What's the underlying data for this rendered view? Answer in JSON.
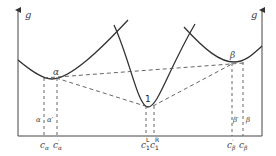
{
  "diagram": {
    "type": "free-energy composition diagram",
    "axes": {
      "left_axis_label": "g",
      "right_axis_label": "g"
    },
    "phases": [
      {
        "id": "alpha",
        "label": "α"
      },
      {
        "id": "one",
        "label": "1"
      },
      {
        "id": "beta",
        "label": "β"
      }
    ],
    "region_labels": {
      "alpha": "α",
      "alpha_prime": "α′",
      "beta_prime": "β′",
      "beta": "β"
    },
    "composition_labels": [
      {
        "id": "c_alpha",
        "main": "c",
        "sub": "α",
        "sup": ""
      },
      {
        "id": "c_alpha_prime",
        "main": "c",
        "sub": "α",
        "sup": "′"
      },
      {
        "id": "c1_L",
        "main": "c",
        "sub": "1",
        "sup": "L"
      },
      {
        "id": "c1_R",
        "main": "c",
        "sub": "1",
        "sup": "R"
      },
      {
        "id": "c_beta_prime",
        "main": "c",
        "sub": "β",
        "sup": "′"
      },
      {
        "id": "c_beta",
        "main": "c",
        "sub": "β",
        "sup": ""
      }
    ],
    "colors": {
      "curve": "#333333",
      "dashed": "#555555",
      "axis": "#444444"
    }
  }
}
